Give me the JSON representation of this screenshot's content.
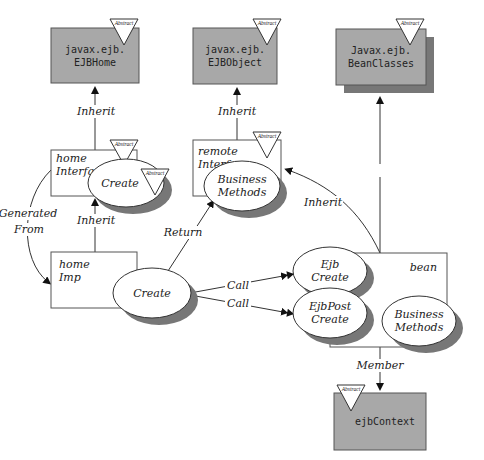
{
  "colors": {
    "class_fill": "#a8a8a8",
    "shadow": "#777777",
    "line": "#333333",
    "ellipse_fill": "#ffffff"
  },
  "abstract_marker": "Abstract",
  "classes": {
    "ejb_home": {
      "line1": "javax.ejb.",
      "line2": "EJBHome"
    },
    "ejb_object": {
      "line1": "javax.ejb.",
      "line2": "EJBObject"
    },
    "bean_classes": {
      "line1": "Javax.ejb.",
      "line2": "BeanClasses"
    },
    "ejb_context": {
      "line1": "ejbContext"
    }
  },
  "components": {
    "home_interface": {
      "line1": "home",
      "line2": "Interface",
      "method": "Create"
    },
    "remote_interface": {
      "line1": "remote",
      "line2": "Interface",
      "method_line1": "Business",
      "method_line2": "Methods"
    },
    "home_imp": {
      "line1": "home",
      "line2": "Imp",
      "method": "Create"
    },
    "bean": {
      "label": "bean",
      "methods": [
        {
          "line1": "Ejb",
          "line2": "Create"
        },
        {
          "line1": "EjbPost",
          "line2": "Create"
        },
        {
          "line1": "Business",
          "line2": "Methods"
        }
      ]
    }
  },
  "relations": {
    "inherit_home": "Inherit",
    "inherit_object": "Inherit",
    "inherit_imp": "Inherit",
    "inherit_bean_classes": "Inherit",
    "inherit_remote": "Inherit",
    "generated_line1": "Generated",
    "generated_line2": "From",
    "return": "Return",
    "call1": "Call",
    "call2": "Call",
    "member": "Member"
  }
}
